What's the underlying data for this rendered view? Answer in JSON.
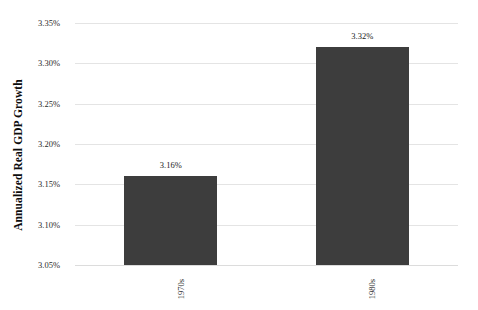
{
  "chart_data": {
    "type": "bar",
    "title": "",
    "xlabel": "",
    "ylabel": "Annualized Real GDP Growth",
    "categories": [
      "1970s",
      "1980s"
    ],
    "values": [
      3.16,
      3.32
    ],
    "value_labels": [
      "3.16%",
      "3.32%"
    ],
    "ylim": [
      3.05,
      3.35
    ],
    "ytick_values": [
      3.35,
      3.3,
      3.25,
      3.2,
      3.15,
      3.1,
      3.05
    ],
    "ytick_labels": [
      "3.35%",
      "3.30%",
      "3.25%",
      "3.20%",
      "3.15%",
      "3.10%",
      "3.05%"
    ],
    "grid": true,
    "legend": null,
    "bar_color": "#3d3d3d",
    "gridline_color": "#e4e4e4",
    "background_color": "#ffffff"
  }
}
